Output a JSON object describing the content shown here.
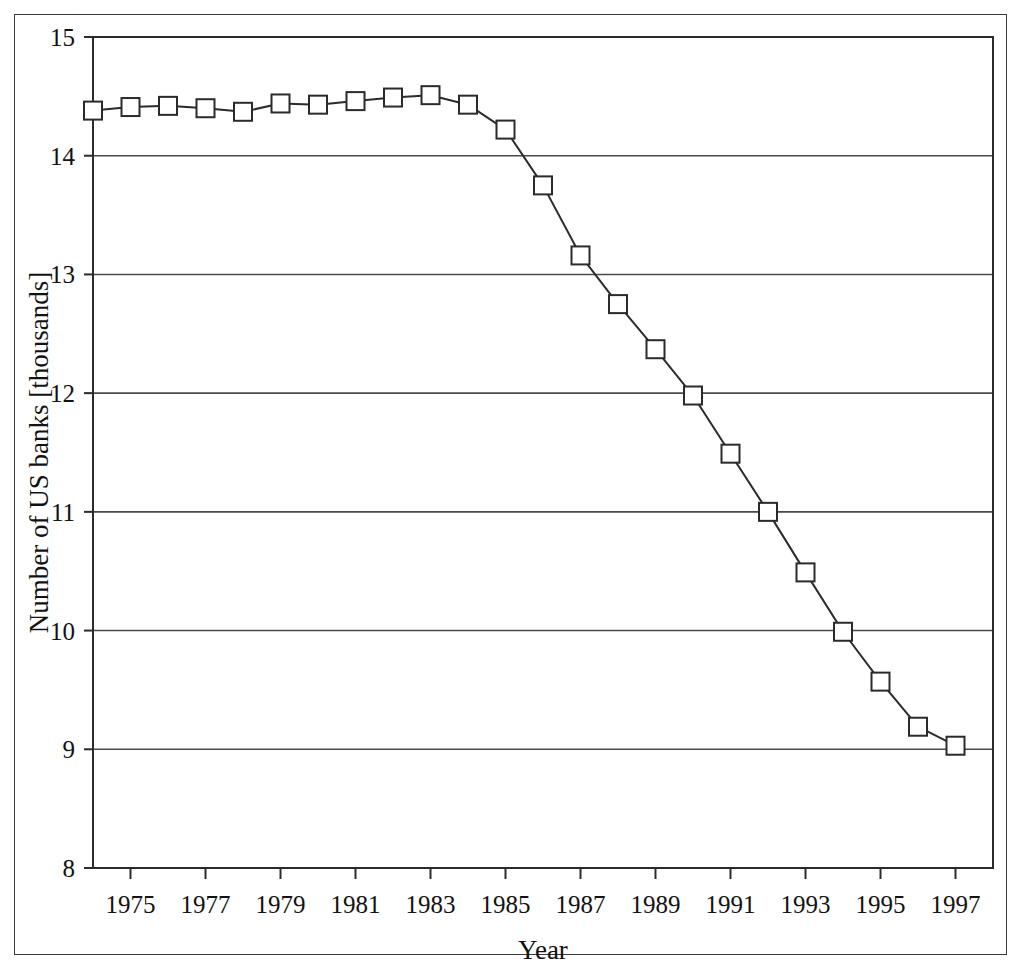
{
  "chart_data": {
    "type": "line",
    "title": "",
    "xlabel": "Year",
    "ylabel": "Number of US banks [thousands]",
    "xlim": [
      1974,
      1998
    ],
    "ylim": [
      8,
      15
    ],
    "grid": "horizontal",
    "legend": "none",
    "marker": "open-square",
    "line_color": "#2b2b2b",
    "x": [
      1974,
      1975,
      1976,
      1977,
      1978,
      1979,
      1980,
      1981,
      1982,
      1983,
      1984,
      1985,
      1986,
      1987,
      1988,
      1989,
      1990,
      1991,
      1992,
      1993,
      1994,
      1995,
      1996,
      1997
    ],
    "values": [
      14.38,
      14.41,
      14.42,
      14.4,
      14.37,
      14.44,
      14.43,
      14.46,
      14.49,
      14.51,
      14.43,
      14.22,
      13.75,
      13.16,
      12.75,
      12.37,
      11.98,
      11.49,
      11.0,
      10.49,
      9.99,
      9.57,
      9.19,
      9.03
    ],
    "ytick_labels": [
      "15",
      "14",
      "13",
      "12",
      "11",
      "10",
      "9",
      "8"
    ],
    "ytick_values": [
      15,
      14,
      13,
      12,
      11,
      10,
      9,
      8
    ],
    "xtick_labels": [
      "1975",
      "1977",
      "1979",
      "1981",
      "1983",
      "1985",
      "1987",
      "1989",
      "1991",
      "1993",
      "1995",
      "1997"
    ],
    "xtick_values": [
      1975,
      1977,
      1979,
      1981,
      1983,
      1985,
      1987,
      1989,
      1991,
      1993,
      1995,
      1997
    ],
    "xminor_values": [
      1974,
      1976,
      1978,
      1980,
      1982,
      1984,
      1986,
      1988,
      1990,
      1992,
      1994,
      1996,
      1998
    ]
  },
  "colors": {
    "frame": "#3a3a3a",
    "axis": "#2b2b2b",
    "gridline": "#4a4a4a",
    "series": "#2b2b2b",
    "background": "#ffffff"
  }
}
